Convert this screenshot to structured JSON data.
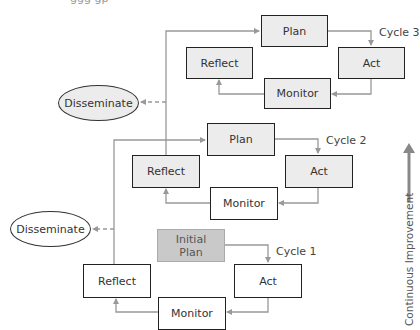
{
  "figure": {
    "top_partial_text": "ggg gp",
    "side_axis": {
      "label": "Continuous Improvement",
      "direction": "up"
    },
    "colors": {
      "box_border": "#222222",
      "shaded_box": "#ececec",
      "initial_plan": "#c9c9c9",
      "connector": "#999999",
      "arrow": "#888888"
    },
    "cycles": [
      {
        "label": "Cycle 1",
        "plan": "Initial\nPlan",
        "plan_line1": "Initial",
        "plan_line2": "Plan",
        "act": "Act",
        "monitor": "Monitor",
        "reflect": "Reflect",
        "disseminate": "Disseminate"
      },
      {
        "label": "Cycle 2",
        "plan": "Plan",
        "act": "Act",
        "monitor": "Monitor",
        "reflect": "Reflect",
        "disseminate": "Disseminate"
      },
      {
        "label": "Cycle 3",
        "plan": "Plan",
        "act": "Act",
        "monitor": "Monitor",
        "reflect": "Reflect"
      }
    ]
  }
}
